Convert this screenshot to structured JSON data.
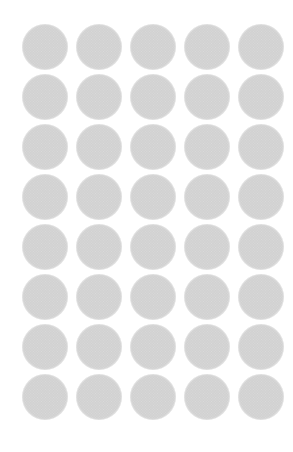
{
  "canvas": {
    "width": 293,
    "height": 452,
    "background_color": "#ffffff",
    "description": "Grid of uniform gray textured circles"
  },
  "grid": {
    "columns": 5,
    "rows": 8,
    "total_circles": 40,
    "circle_diameter": 46,
    "column_pitch": 54,
    "row_pitch": 50,
    "origin_x": 22,
    "origin_y": 24,
    "column_x": [
      22,
      76,
      130,
      184,
      238
    ],
    "row_y": [
      24,
      74,
      124,
      174,
      224,
      274,
      324,
      374
    ]
  },
  "circle_style": {
    "fill_color": "#c9c9c9",
    "texture": "fine-noise-halftone",
    "edge": "anti-aliased-soft",
    "shape": "circle"
  }
}
